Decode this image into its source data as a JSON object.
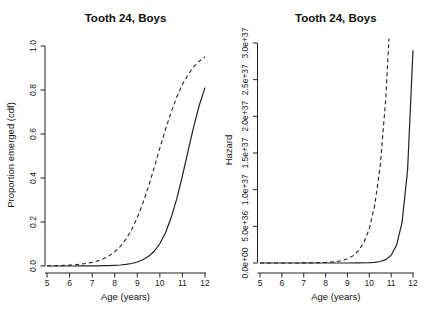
{
  "figure": {
    "background": "#ffffff",
    "line_color": "#222222"
  },
  "chart_data": [
    {
      "type": "line",
      "title": "Tooth 24, Boys",
      "xlabel": "Age (years)",
      "ylabel": "Proportion emerged (cdf)",
      "xlim": [
        5,
        12
      ],
      "ylim": [
        0,
        1.0
      ],
      "x_ticks": [
        5,
        6,
        7,
        8,
        9,
        10,
        11,
        12
      ],
      "y_ticks": [
        0.0,
        0.2,
        0.4,
        0.6,
        0.8,
        1.0
      ],
      "y_tick_labels": [
        "0.0",
        "0.2",
        "0.4",
        "0.6",
        "0.8",
        "1.0"
      ],
      "grid": false,
      "legend": "none",
      "series": [
        {
          "name": "dashed-cdf",
          "style": "dashed",
          "x": [
            5,
            5.25,
            5.5,
            5.75,
            6,
            6.25,
            6.5,
            6.75,
            7,
            7.25,
            7.5,
            7.75,
            8,
            8.25,
            8.5,
            8.75,
            9,
            9.25,
            9.5,
            9.75,
            10,
            10.25,
            10.5,
            10.75,
            11,
            11.25,
            11.5,
            11.75,
            12
          ],
          "y": [
            0.001,
            0.0014,
            0.002,
            0.0029,
            0.0041,
            0.0058,
            0.0083,
            0.0117,
            0.0165,
            0.0234,
            0.0329,
            0.0462,
            0.0645,
            0.0894,
            0.122,
            0.165,
            0.22,
            0.286,
            0.363,
            0.447,
            0.535,
            0.621,
            0.699,
            0.768,
            0.825,
            0.87,
            0.905,
            0.931,
            0.951
          ]
        },
        {
          "name": "solid-cdf",
          "style": "solid",
          "x": [
            5,
            5.25,
            5.5,
            5.75,
            6,
            6.25,
            6.5,
            6.75,
            7,
            7.25,
            7.5,
            7.75,
            8,
            8.25,
            8.5,
            8.75,
            9,
            9.25,
            9.5,
            9.75,
            10,
            10.25,
            10.5,
            10.75,
            11,
            11.25,
            11.5,
            11.75,
            12
          ],
          "y": [
            0.0,
            0.0,
            0.0001,
            0.0001,
            0.0001,
            0.0002,
            0.0003,
            0.0004,
            0.0005,
            0.0008,
            0.0012,
            0.0019,
            0.003,
            0.0047,
            0.0073,
            0.0115,
            0.018,
            0.028,
            0.044,
            0.067,
            0.101,
            0.151,
            0.219,
            0.306,
            0.41,
            0.523,
            0.633,
            0.731,
            0.811
          ]
        }
      ]
    },
    {
      "type": "line",
      "title": "Tooth 24, Boys",
      "xlabel": "Age (years)",
      "ylabel": "Hazard",
      "xlim": [
        5,
        12
      ],
      "ylim": [
        0,
        3e+37
      ],
      "x_ticks": [
        5,
        6,
        7,
        8,
        9,
        10,
        11,
        12
      ],
      "y_ticks": [
        0,
        5e+36,
        1e+37,
        1.5e+37,
        2e+37,
        2.5e+37,
        3e+37
      ],
      "y_tick_labels": [
        "0.0e+00",
        "5.0e+36",
        "1.0e+37",
        "1.5e+37",
        "2.0e+37",
        "2.5e+37",
        "3.0e+37"
      ],
      "grid": false,
      "legend": "none",
      "series": [
        {
          "name": "dashed-hazard",
          "style": "dashed",
          "x": [
            5,
            5.5,
            6,
            6.5,
            7,
            7.5,
            8,
            8.25,
            8.5,
            8.75,
            9,
            9.25,
            9.5,
            9.75,
            10,
            10.25,
            10.5,
            10.75,
            10.9
          ],
          "y": [
            1.3e+32,
            3.7e+32,
            1.06e+33,
            3.03e+33,
            8.66e+33,
            2.48e+34,
            7.08e+34,
            1.2e+35,
            2e+35,
            3.39e+35,
            5.74e+35,
            9.7e+35,
            1.64e+36,
            2.78e+36,
            4.63e+36,
            7.94e+36,
            1.32e+37,
            2.23e+37,
            3.06e+37
          ]
        },
        {
          "name": "solid-hazard",
          "style": "solid",
          "x": [
            5,
            5.5,
            6,
            6.5,
            7,
            7.5,
            8,
            8.5,
            9,
            9.5,
            10,
            10.25,
            10.5,
            10.75,
            11,
            11.25,
            11.5,
            11.75,
            12
          ],
          "y": [
            0.0,
            0.0,
            0.0,
            0.0,
            0.0,
            0.0,
            5.3e+31,
            2.8e+32,
            1.45e+33,
            7.6e+33,
            3.94e+34,
            9e+34,
            2.05e+35,
            4.69e+35,
            1.07e+36,
            2.44e+36,
            5.57e+36,
            1.27e+37,
            2.9e+37
          ]
        }
      ]
    }
  ]
}
